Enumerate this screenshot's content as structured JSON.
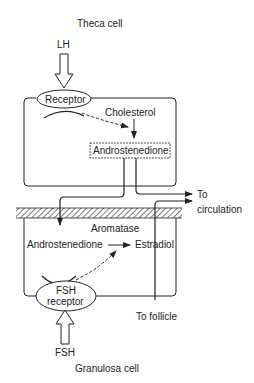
{
  "labels": {
    "theca_cell": "Theca cell",
    "lh": "LH",
    "receptor": "Receptor",
    "cholesterol": "Cholesterol",
    "androstenedione_theca": "Androstenedione",
    "to": "To",
    "circulation": "circulation",
    "aromatase": "Aromatase",
    "androstenedione_granulosa": "Androstenedione",
    "estradiol": "Estradiol",
    "fsh_receptor_line1": "FSH",
    "fsh_receptor_line2": "receptor",
    "to_follicle": "To follicle",
    "fsh": "FSH",
    "granulosa_cell": "Granulosa cell"
  },
  "colors": {
    "stroke": "#222222",
    "background": "#ffffff"
  }
}
